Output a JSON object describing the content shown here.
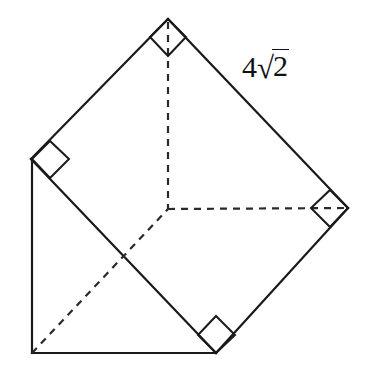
{
  "figure": {
    "type": "geometry-diagram",
    "canvas": {
      "width": 375,
      "height": 374,
      "background": "#ffffff"
    },
    "stroke_color": "#1a1a1a",
    "points": {
      "top": {
        "name": "top-vertex",
        "x": 168,
        "y": 19
      },
      "left": {
        "name": "left-vertex",
        "x": 31,
        "y": 159
      },
      "right": {
        "name": "right-vertex",
        "x": 348,
        "y": 208
      },
      "bottom": {
        "name": "bottom-vertex",
        "x": 216,
        "y": 353
      },
      "bottom_left": {
        "name": "bottom-left-corner",
        "x": 32,
        "y": 353
      },
      "center": {
        "name": "center-junction",
        "x": 168,
        "y": 209
      }
    },
    "solid_edges": [
      {
        "name": "edge-left-to-top",
        "from": "left",
        "to": "top"
      },
      {
        "name": "edge-top-to-right",
        "from": "top",
        "to": "right"
      },
      {
        "name": "edge-right-to-bottom",
        "from": "right",
        "to": "bottom"
      },
      {
        "name": "edge-left-to-bottom",
        "from": "left",
        "to": "bottom"
      },
      {
        "name": "edge-left-to-bottom-left",
        "from": "left",
        "to": "bottom_left"
      },
      {
        "name": "edge-bottom-left-to-bottom",
        "from": "bottom_left",
        "to": "bottom"
      }
    ],
    "dashed_edges": [
      {
        "name": "dashed-top-to-center",
        "from": "top",
        "to": "center"
      },
      {
        "name": "dashed-center-to-right",
        "from": "center",
        "to": "right"
      },
      {
        "name": "dashed-bottom-left-to-center",
        "from": "bottom_left",
        "to": "center"
      }
    ],
    "right_angle_marks": [
      {
        "name": "right-angle-mark-top",
        "at": "top"
      },
      {
        "name": "right-angle-mark-left",
        "at": "left"
      },
      {
        "name": "right-angle-mark-right",
        "at": "right"
      },
      {
        "name": "right-angle-mark-bottom",
        "at": "bottom"
      }
    ]
  },
  "labels": {
    "side_length": {
      "name": "side-length-label",
      "coefficient": "4",
      "radical_sign": "√",
      "radicand": "2",
      "full_text": "4√2",
      "x": 242,
      "y": 50
    }
  }
}
